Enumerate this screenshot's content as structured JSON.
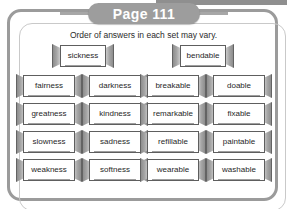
{
  "page": {
    "header_label": "Page 111",
    "instruction": "Order of answers in each set may vary.",
    "accent_gray": "#9d9d9d",
    "frame_gray": "#9b9b9b",
    "text_color": "#1f1f1f"
  },
  "headers": [
    {
      "word": "sickness"
    },
    {
      "word": "bendable"
    }
  ],
  "rows": [
    [
      {
        "word": "fairness"
      },
      {
        "word": "darkness"
      },
      {
        "word": "breakable"
      },
      {
        "word": "doable"
      }
    ],
    [
      {
        "word": "greatness"
      },
      {
        "word": "kindness"
      },
      {
        "word": "remarkable"
      },
      {
        "word": "fixable"
      }
    ],
    [
      {
        "word": "slowness"
      },
      {
        "word": "sadness"
      },
      {
        "word": "refillable"
      },
      {
        "word": "paintable"
      }
    ],
    [
      {
        "word": "weakness"
      },
      {
        "word": "softness"
      },
      {
        "word": "wearable"
      },
      {
        "word": "washable"
      }
    ]
  ]
}
